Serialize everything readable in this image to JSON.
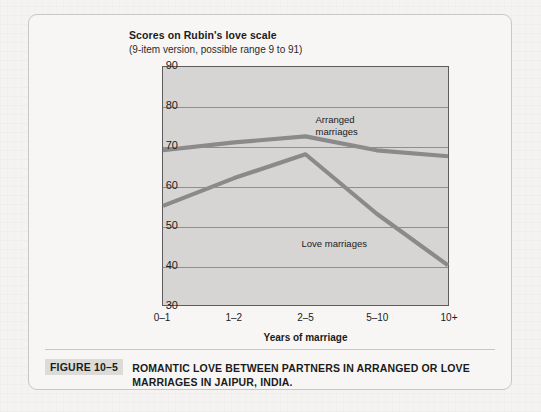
{
  "figure": {
    "tag": "FIGURE 10–5",
    "caption": "ROMANTIC LOVE BETWEEN PARTNERS IN ARRANGED OR LOVE MARRIAGES IN JAIPUR, INDIA."
  },
  "chart_data": {
    "type": "line",
    "title": "Scores on Rubin's love scale",
    "subtitle": "(9-item version, possible range 9 to 91)",
    "xlabel": "Years of marriage",
    "ylabel": "",
    "categories": [
      "0–1",
      "1–2",
      "2–5",
      "5–10",
      "10+"
    ],
    "series": [
      {
        "name": "Arranged marriages",
        "values": [
          69,
          71,
          72.5,
          69,
          67.5
        ],
        "color": "#8a8a8a",
        "label_text": "Arranged\nmarriages"
      },
      {
        "name": "Love marriages",
        "values": [
          55,
          62,
          68,
          53,
          40
        ],
        "color": "#8a8a8a",
        "label_text": "Love marriages"
      }
    ],
    "ylim": [
      30,
      90
    ],
    "yticks": [
      30,
      40,
      50,
      60,
      70,
      80,
      90
    ],
    "grid": true,
    "legend": "inline-annotations",
    "plot_background": "#d6d5d3",
    "grid_color": "#8e8e8e",
    "axis_color": "#5d5d5d"
  }
}
